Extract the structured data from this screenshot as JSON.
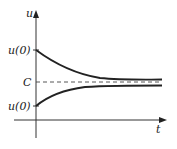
{
  "diagram": {
    "axes": {
      "x_label": "t",
      "y_label": "u"
    },
    "tick_labels": {
      "upper_initial": "u(0)",
      "equilibrium": "C",
      "lower_initial": "u(0)"
    },
    "curves": [
      {
        "name": "decaying-from-above",
        "start_label": "u(0)",
        "approaches": "C"
      },
      {
        "name": "rising-from-below",
        "start_label": "u(0)",
        "approaches": "C"
      }
    ],
    "equilibrium_line": {
      "label": "C",
      "style": "dashed"
    },
    "colors": {
      "ink": "#222222",
      "background": "#ffffff"
    }
  }
}
